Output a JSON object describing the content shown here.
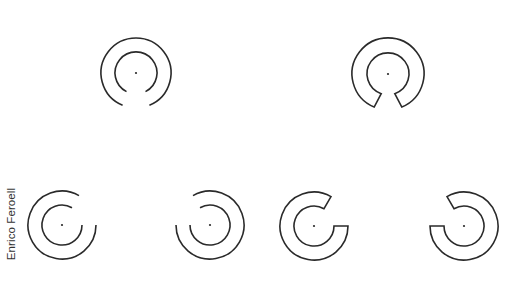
{
  "author_label": "Enrico Feroell",
  "colors": {
    "stroke": "#2a2a2a",
    "background": "#ffffff",
    "text": "#333333"
  },
  "figures": [
    {
      "id": "top-left",
      "type": "open-arcs",
      "center": [
        136,
        73
      ],
      "outer_r": 35,
      "inner_r": 21,
      "gap_direction": "down"
    },
    {
      "id": "top-right",
      "type": "closed-ring-with-gap",
      "center": [
        388,
        74
      ],
      "outer_r": 36,
      "inner_r": 21,
      "gap_direction": "down"
    },
    {
      "id": "bottom-1",
      "type": "open-arcs",
      "center": [
        62,
        225
      ],
      "outer_r": 34,
      "inner_r": 20,
      "gap_direction": "upper-right"
    },
    {
      "id": "bottom-2",
      "type": "open-arcs",
      "center": [
        210,
        225
      ],
      "outer_r": 34,
      "inner_r": 20,
      "gap_direction": "upper-left"
    },
    {
      "id": "bottom-3",
      "type": "closed-ring-with-gap",
      "center": [
        314,
        226
      ],
      "outer_r": 34,
      "inner_r": 20,
      "gap_direction": "upper-right"
    },
    {
      "id": "bottom-4",
      "type": "closed-ring-with-gap",
      "center": [
        464,
        226
      ],
      "outer_r": 34,
      "inner_r": 20,
      "gap_direction": "upper-left"
    }
  ]
}
